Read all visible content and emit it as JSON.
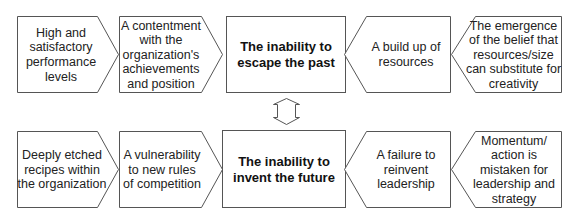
{
  "diagram": {
    "top_row": {
      "center": {
        "text": "The inability to escape the past",
        "lines": [
          "The inability to",
          "escape the past"
        ]
      },
      "left": [
        {
          "lines": [
            "High and",
            "satisfactory",
            "performance",
            "levels"
          ]
        },
        {
          "lines": [
            "A contentment",
            "with the",
            "organization's",
            "achievements",
            "and position"
          ]
        }
      ],
      "right": [
        {
          "lines": [
            "A build up of",
            "resources"
          ]
        },
        {
          "lines": [
            "The emergence",
            "of the belief that",
            "resources/size",
            "can substitute for",
            "creativity"
          ]
        }
      ]
    },
    "bottom_row": {
      "center": {
        "text": "The inability to invent the future",
        "lines": [
          "The inability to",
          "invent the future"
        ]
      },
      "left": [
        {
          "lines": [
            "Deeply etched",
            "recipes within",
            "the organization"
          ]
        },
        {
          "lines": [
            "A vulnerability",
            "to new rules",
            "of competition"
          ]
        }
      ],
      "right": [
        {
          "lines": [
            "A failure to",
            "reinvent",
            "leadership"
          ]
        },
        {
          "lines": [
            "Momentum/",
            "action is",
            "mistaken for",
            "leadership and",
            "strategy"
          ]
        }
      ]
    },
    "connector": {
      "type": "double-headed vertical arrow"
    },
    "colors": {
      "stroke": "#555555",
      "fill": "#ffffff",
      "text": "#222222"
    }
  }
}
